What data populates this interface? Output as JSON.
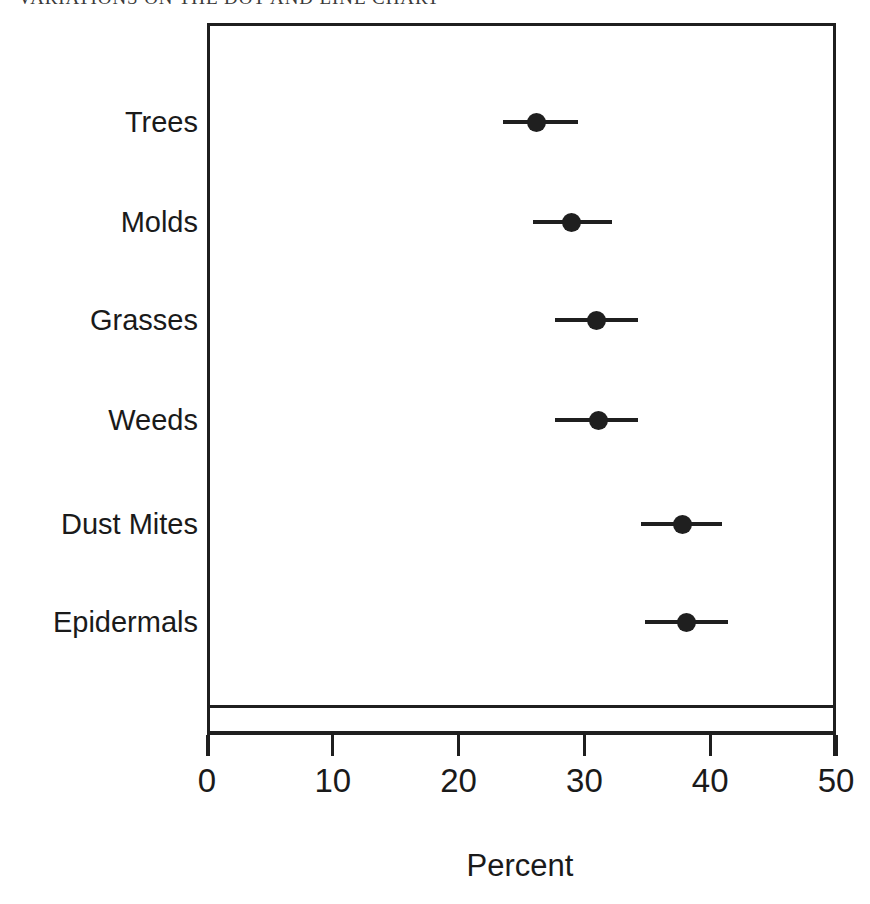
{
  "chart_data": {
    "type": "scatter",
    "title": "VARIATIONS ON THE DOT AND LINE CHART",
    "xlabel": "Percent",
    "ylabel": "",
    "xlim": [
      0,
      50
    ],
    "xticks": [
      0,
      10,
      20,
      30,
      40,
      50
    ],
    "xtick_labels": [
      "0",
      "10",
      "20",
      "30",
      "40",
      "50"
    ],
    "grid": false,
    "legend": null,
    "orientation": "horizontal",
    "marker": "filled-circle",
    "error_bars": "horizontal",
    "categories": [
      "Trees",
      "Molds",
      "Grasses",
      "Weeds",
      "Dust Mites",
      "Epidermals"
    ],
    "values": [
      26.2,
      29.0,
      31.0,
      31.1,
      37.8,
      38.1
    ],
    "error_low": [
      23.5,
      25.9,
      27.7,
      27.7,
      34.5,
      34.8
    ],
    "error_high": [
      29.5,
      32.2,
      34.3,
      34.3,
      40.9,
      41.4
    ],
    "points": [
      {
        "category": "Trees",
        "value": 26.2,
        "low": 23.5,
        "high": 29.5
      },
      {
        "category": "Molds",
        "value": 29.0,
        "low": 25.9,
        "high": 32.2
      },
      {
        "category": "Grasses",
        "value": 31.0,
        "low": 27.7,
        "high": 34.3
      },
      {
        "category": "Weeds",
        "value": 31.1,
        "low": 27.7,
        "high": 34.3
      },
      {
        "category": "Dust Mites",
        "value": 37.8,
        "low": 34.5,
        "high": 40.9
      },
      {
        "category": "Epidermals",
        "value": 38.1,
        "low": 34.8,
        "high": 41.4
      }
    ],
    "colors": {
      "marker": "#1f1f1f",
      "line": "#1f1f1f",
      "axis": "#1f1f1f",
      "text": "#1a1a1a",
      "background": "#ffffff"
    }
  }
}
